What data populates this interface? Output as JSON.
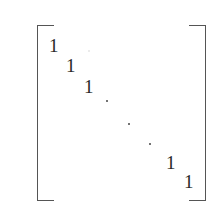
{
  "matrix": {
    "type": "identity",
    "entries": [
      {
        "label": "1",
        "x": 49,
        "y": 36
      },
      {
        "label": "1",
        "x": 66,
        "y": 56
      },
      {
        "label": "1",
        "x": 84,
        "y": 77
      },
      {
        "label": "1",
        "x": 166,
        "y": 153
      },
      {
        "label": "1",
        "x": 184,
        "y": 172
      }
    ],
    "ellipsis_dots": [
      {
        "x": 106,
        "y": 100
      },
      {
        "x": 128,
        "y": 123
      },
      {
        "x": 149,
        "y": 143
      }
    ],
    "faint_dot": {
      "x": 88,
      "y": 50
    }
  }
}
